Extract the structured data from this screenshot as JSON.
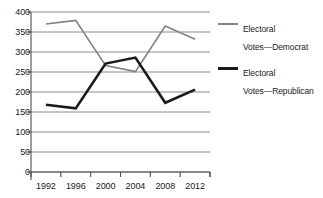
{
  "chart_data": {
    "type": "line",
    "title": "",
    "xlabel": "",
    "ylabel": "",
    "categories": [
      "1992",
      "1996",
      "2000",
      "2004",
      "2008",
      "2012"
    ],
    "x": [
      1992,
      1996,
      2000,
      2004,
      2008,
      2012
    ],
    "ylim": [
      0,
      400
    ],
    "y_ticks": [
      0,
      50,
      100,
      150,
      200,
      250,
      300,
      350,
      400
    ],
    "y_tick_labels": [
      "0",
      "50",
      "100",
      "150",
      "200",
      "250",
      "300",
      "350",
      "400"
    ],
    "grid": true,
    "grid_axis": "y",
    "legend_position": "right",
    "series": [
      {
        "name": "Electoral\nVotes—Democrat",
        "label_line1": "Electoral",
        "label_line2": "Votes—Democrat",
        "color": "#808080",
        "width": 1.6,
        "values": [
          370,
          379,
          266,
          251,
          365,
          332
        ]
      },
      {
        "name": "Electoral\nVotes—Republican",
        "label_line1": "Electoral",
        "label_line2": "Votes—Republican",
        "color": "#1a1a1a",
        "width": 2.6,
        "values": [
          168,
          159,
          271,
          286,
          173,
          206
        ]
      }
    ]
  },
  "axes": {
    "axis_color": "#4d4d4d",
    "grid_color": "#808080"
  },
  "legend": {
    "entries": [
      {
        "line1": "Electoral",
        "line2": "Votes—Democrat"
      },
      {
        "line1": "Electoral",
        "line2": "Votes—Republican"
      }
    ]
  }
}
